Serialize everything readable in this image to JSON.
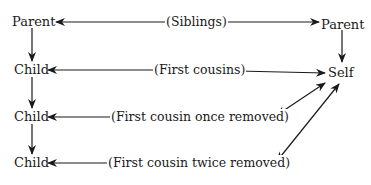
{
  "diagram": {
    "type": "family-relationship",
    "nodes": {
      "left_parent": "Parent",
      "child1": "Child",
      "child2": "Child",
      "child3": "Child",
      "right_parent": "Parent",
      "self": "Self"
    },
    "relations": {
      "siblings": "(Siblings)",
      "first_cousins": "(First cousins)",
      "once_removed": "(First cousin once removed)",
      "twice_removed": "(First cousin twice removed)"
    },
    "edges": [
      {
        "from": "left_parent",
        "to": "right_parent",
        "label": "siblings",
        "style": "double-arrow"
      },
      {
        "from": "child1",
        "to": "self",
        "label": "first_cousins",
        "style": "double-arrow"
      },
      {
        "from": "child2",
        "to": "self",
        "label": "once_removed",
        "style": "double-arrow"
      },
      {
        "from": "child3",
        "to": "self",
        "label": "twice_removed",
        "style": "double-arrow"
      },
      {
        "from": "left_parent",
        "to": "child1",
        "style": "arrow"
      },
      {
        "from": "child1",
        "to": "child2",
        "style": "arrow"
      },
      {
        "from": "child2",
        "to": "child3",
        "style": "arrow"
      },
      {
        "from": "right_parent",
        "to": "self",
        "style": "arrow"
      }
    ],
    "colors": {
      "line": "#1a1a1a",
      "text": "#1a1a1a",
      "background": "#ffffff"
    }
  }
}
